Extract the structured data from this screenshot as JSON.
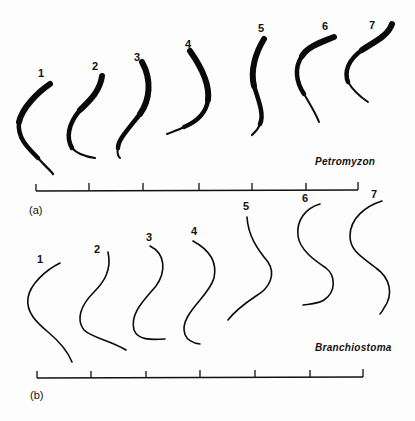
{
  "figure": {
    "panel_a": {
      "label": "(a)",
      "species": "Petromyzon",
      "frames": [
        {
          "n": "1"
        },
        {
          "n": "2"
        },
        {
          "n": "3"
        },
        {
          "n": "4"
        },
        {
          "n": "5"
        },
        {
          "n": "6"
        },
        {
          "n": "7"
        }
      ],
      "scale_ticks": 7
    },
    "panel_b": {
      "label": "(b)",
      "species": "Branchiostoma",
      "frames": [
        {
          "n": "1"
        },
        {
          "n": "2"
        },
        {
          "n": "3"
        },
        {
          "n": "4"
        },
        {
          "n": "5"
        },
        {
          "n": "6"
        },
        {
          "n": "7"
        }
      ],
      "scale_ticks": 7
    },
    "colors": {
      "ink": "#0a0a0a",
      "background": "#fdfdfd"
    }
  }
}
